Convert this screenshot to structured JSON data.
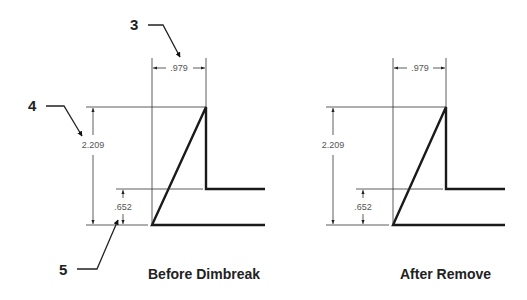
{
  "callouts": [
    {
      "label": "3"
    },
    {
      "label": "4"
    },
    {
      "label": "5"
    }
  ],
  "figures": [
    {
      "caption": "Before Dimbreak",
      "dimensions": {
        "width": ".979",
        "height": "2.209",
        "step": ".652"
      }
    },
    {
      "caption": "After Remove",
      "dimensions": {
        "width": ".979",
        "height": "2.209",
        "step": ".652"
      }
    }
  ],
  "colors": {
    "line": "#1a1a1a",
    "dimension": "#555555",
    "background": "#ffffff"
  }
}
